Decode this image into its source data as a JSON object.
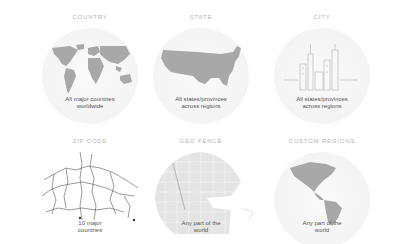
{
  "tiles": [
    {
      "id": "country",
      "label": "COUNTRY",
      "caption_line1": "All major countries",
      "caption_line2": "worldwide",
      "icon": "world-map-icon"
    },
    {
      "id": "state",
      "label": "STATE",
      "caption_line1": "All states/provinces",
      "caption_line2": "across regions",
      "icon": "usa-map-icon"
    },
    {
      "id": "city",
      "label": "CITY",
      "caption_line1": "All states/provinces",
      "caption_line2": "across regions",
      "icon": "city-skyline-icon"
    },
    {
      "id": "zip-code",
      "label": "ZIP CODE",
      "caption_line1": "10 major",
      "caption_line2": "countries",
      "icon": "road-map-icon"
    },
    {
      "id": "geo-fence",
      "label": "GEO FENCE",
      "caption_line1": "Any part of the",
      "caption_line2": "world",
      "icon": "street-grid-icon"
    },
    {
      "id": "custom-regions",
      "label": "CUSTOM REGIONS",
      "caption_line1": "Any part of the",
      "caption_line2": "world",
      "icon": "americas-globe-icon"
    }
  ],
  "colors": {
    "label": "#b4b4b4",
    "caption": "#555555",
    "map_fill": "#a8a8a8",
    "circle_bg": "#f4f4f4"
  }
}
